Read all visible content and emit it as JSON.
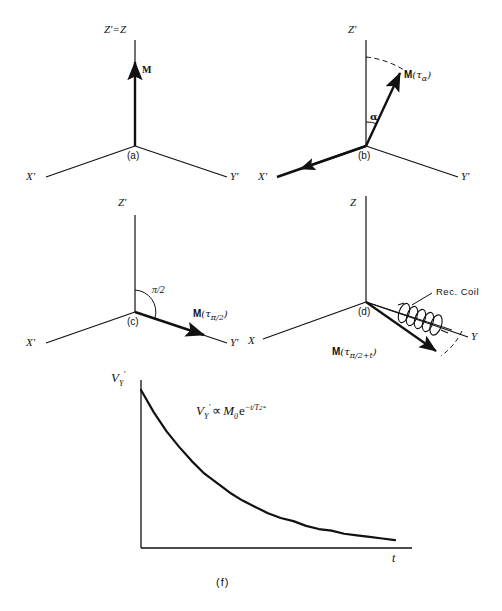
{
  "figure": {
    "background_color": "#ffffff",
    "line_color": "#111111"
  },
  "panels": [
    {
      "id": "a",
      "caption": "(a)",
      "axes": {
        "z": "Z'=Z",
        "x": "X'",
        "y": "Y'"
      },
      "vectors": [
        {
          "label": "M",
          "name": "magnetization-vector",
          "direction": "along +Z'"
        }
      ],
      "arcs": []
    },
    {
      "id": "b",
      "caption": "(b)",
      "axes": {
        "z": "Z'",
        "x": "X'",
        "y": "Y'"
      },
      "vectors": [
        {
          "label_m": "M",
          "label_arg": "(τ",
          "label_sub": "α",
          "label_close": ")",
          "name": "magnetization-vector-tau-alpha"
        },
        {
          "label": "",
          "name": "b1-field-arrow-x",
          "direction": "along -X'"
        }
      ],
      "angle_label": "α",
      "arcs": [
        "solid-alpha-arc",
        "dashed-tip-arc"
      ]
    },
    {
      "id": "c",
      "caption": "(c)",
      "axes": {
        "z": "Z'",
        "x": "X'",
        "y": "Y'"
      },
      "vectors": [
        {
          "label_m": "M",
          "label_arg": "(τ",
          "label_sub": "π/2",
          "label_close": ")",
          "name": "magnetization-vector-tau-pi-over-2"
        }
      ],
      "angle_label": "π/2",
      "arcs": [
        "solid-quarter-arc"
      ]
    },
    {
      "id": "d",
      "caption": "(d)",
      "axes": {
        "z": "Z",
        "x": "X",
        "y": "Y"
      },
      "vectors": [
        {
          "label_m": "M",
          "label_arg": "(τ",
          "label_sub": "π/2",
          "label_plus": "+t",
          "label_close": ")",
          "name": "magnetization-vector-tau-pi-over-2-plus-t"
        }
      ],
      "coil_label": "Rec. Coil",
      "arcs": [
        "dashed-precession-arc"
      ]
    },
    {
      "id": "f",
      "caption": "(f)",
      "y_axis_label_v": "V",
      "y_axis_label_sub": "Y",
      "y_axis_label_prime": "'",
      "x_axis_label": "t",
      "formula_parts": {
        "v": "V",
        "v_sub": "Y",
        "v_prime": "'",
        "prop": "∝",
        "m": "M",
        "m_sub": "0",
        "e": "e",
        "exp_num": "−t/T",
        "exp_sub": "2",
        "exp_star": "*"
      },
      "formula_plain": "V_Y' ∝ M₀ e^(-t/T₂*)"
    }
  ],
  "chart_data": {
    "type": "line",
    "xlabel": "t",
    "ylabel": "V_Y'",
    "grid": false,
    "legend": null,
    "annotations": [
      "V_Y' ∝ M₀ e^(-t/T₂*)"
    ],
    "xlim": [
      0,
      1
    ],
    "ylim": [
      0,
      1
    ],
    "x": [
      0.0,
      0.05,
      0.1,
      0.15,
      0.2,
      0.25,
      0.3,
      0.35,
      0.4,
      0.45,
      0.5,
      0.55,
      0.6,
      0.65,
      0.7,
      0.75,
      0.8,
      0.85,
      0.9,
      0.95,
      1.0
    ],
    "y": [
      1.0,
      0.86,
      0.74,
      0.64,
      0.55,
      0.47,
      0.41,
      0.35,
      0.3,
      0.26,
      0.22,
      0.19,
      0.17,
      0.14,
      0.12,
      0.11,
      0.09,
      0.08,
      0.07,
      0.06,
      0.05
    ],
    "decay_constant": "T2*"
  }
}
